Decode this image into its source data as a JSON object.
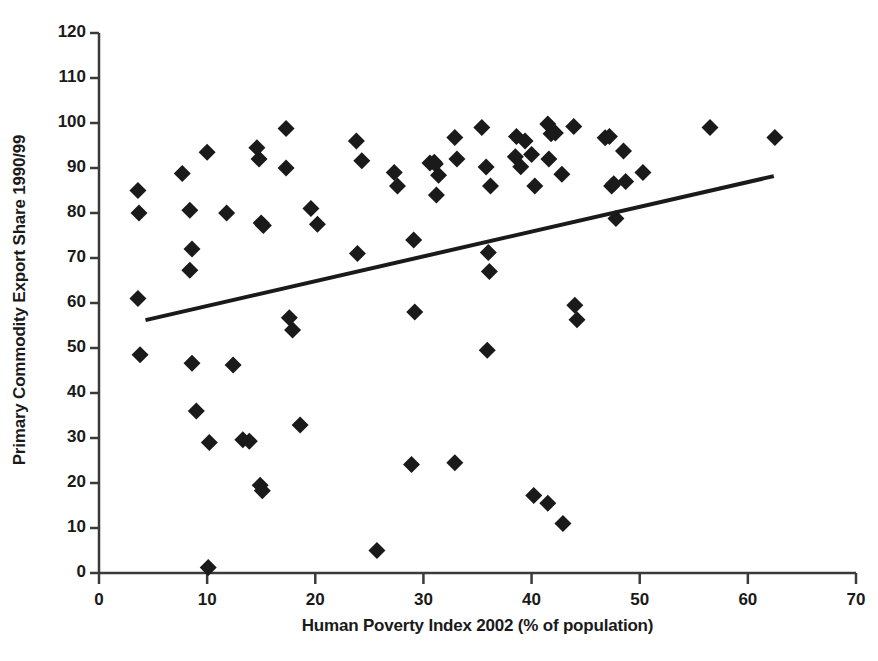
{
  "chart_data": {
    "type": "scatter",
    "title": "",
    "xlabel": "Human Poverty Index 2002 (% of population)",
    "ylabel": "Primary Commodity Export Share 1990/99",
    "xlim": [
      0,
      70
    ],
    "ylim": [
      0,
      120
    ],
    "xticks": [
      0,
      10,
      20,
      30,
      40,
      50,
      60,
      70
    ],
    "yticks": [
      0,
      10,
      20,
      30,
      40,
      50,
      60,
      70,
      80,
      90,
      100,
      110,
      120
    ],
    "grid": false,
    "legend": null,
    "marker": "diamond",
    "marker_color": "#1a1a1a",
    "points": [
      [
        3.6,
        85.0
      ],
      [
        3.7,
        80.0
      ],
      [
        3.6,
        61.0
      ],
      [
        3.8,
        48.5
      ],
      [
        7.7,
        88.8
      ],
      [
        8.4,
        80.6
      ],
      [
        8.6,
        72.0
      ],
      [
        8.4,
        67.3
      ],
      [
        8.6,
        46.6
      ],
      [
        9.0,
        36.0
      ],
      [
        10.0,
        93.5
      ],
      [
        10.2,
        29.0
      ],
      [
        10.1,
        1.2
      ],
      [
        11.8,
        80.0
      ],
      [
        12.4,
        46.2
      ],
      [
        13.3,
        29.6
      ],
      [
        13.9,
        29.3
      ],
      [
        14.6,
        94.5
      ],
      [
        14.8,
        92.0
      ],
      [
        15.0,
        77.8
      ],
      [
        15.2,
        77.2
      ],
      [
        14.9,
        19.5
      ],
      [
        15.1,
        18.3
      ],
      [
        17.3,
        98.8
      ],
      [
        17.3,
        90.0
      ],
      [
        17.6,
        56.7
      ],
      [
        17.9,
        54.0
      ],
      [
        18.6,
        32.9
      ],
      [
        19.6,
        81.0
      ],
      [
        20.2,
        77.5
      ],
      [
        23.8,
        96.0
      ],
      [
        24.3,
        91.6
      ],
      [
        23.9,
        71.0
      ],
      [
        25.7,
        5.0
      ],
      [
        27.3,
        89.0
      ],
      [
        27.6,
        86.0
      ],
      [
        29.1,
        74.0
      ],
      [
        29.2,
        58.0
      ],
      [
        28.9,
        24.1
      ],
      [
        30.6,
        91.1
      ],
      [
        31.0,
        91.3
      ],
      [
        31.1,
        90.9
      ],
      [
        31.4,
        88.4
      ],
      [
        31.2,
        84.0
      ],
      [
        32.9,
        96.8
      ],
      [
        33.1,
        92.0
      ],
      [
        32.9,
        24.5
      ],
      [
        35.4,
        99.0
      ],
      [
        35.8,
        90.2
      ],
      [
        36.2,
        86.0
      ],
      [
        36.0,
        71.2
      ],
      [
        36.1,
        67.0
      ],
      [
        35.9,
        49.5
      ],
      [
        38.6,
        97.0
      ],
      [
        38.5,
        92.5
      ],
      [
        39.0,
        90.3
      ],
      [
        39.4,
        96.0
      ],
      [
        40.0,
        93.0
      ],
      [
        40.3,
        86.0
      ],
      [
        40.2,
        17.2
      ],
      [
        41.5,
        99.8
      ],
      [
        41.8,
        97.6
      ],
      [
        41.6,
        92.0
      ],
      [
        41.5,
        15.5
      ],
      [
        42.2,
        97.8
      ],
      [
        42.8,
        88.6
      ],
      [
        42.9,
        11.0
      ],
      [
        43.9,
        99.2
      ],
      [
        44.0,
        59.5
      ],
      [
        44.2,
        56.3
      ],
      [
        46.8,
        96.7
      ],
      [
        47.2,
        97.0
      ],
      [
        47.4,
        86.0
      ],
      [
        47.6,
        86.5
      ],
      [
        47.8,
        78.8
      ],
      [
        48.5,
        93.8
      ],
      [
        48.7,
        87.0
      ],
      [
        50.3,
        89.0
      ],
      [
        56.5,
        99.0
      ],
      [
        62.5,
        96.8
      ]
    ],
    "trendline": {
      "x0": 4.3,
      "y0": 56.2,
      "x1": 62.4,
      "y1": 88.2,
      "color": "#1a1a1a",
      "width": 4
    }
  }
}
